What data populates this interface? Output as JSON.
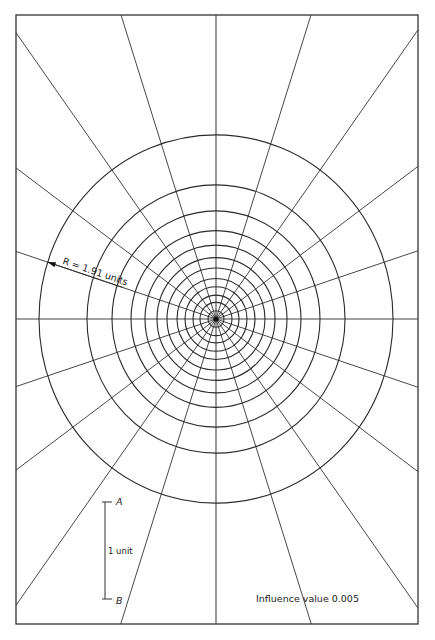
{
  "diagram": {
    "type": "influence chart (Newmark-style radial grid)",
    "frame": {
      "x": 16,
      "y": 15,
      "width": 402,
      "height": 609
    },
    "center": {
      "x": 216,
      "y": 319
    },
    "vertical_stretch": 1.04,
    "ray_count": 20,
    "ray_angle_step_deg": 18,
    "ring_radii_px": [
      8,
      16,
      23,
      31,
      39,
      49,
      59,
      71,
      85,
      104,
      129,
      177
    ],
    "radius_annotation": {
      "text": "R = 1.91 units",
      "arrow_tip": {
        "x": 40,
        "y": 261
      },
      "angle_deg": 18.5
    },
    "scale_bar": {
      "x": 105,
      "y_top": 502,
      "y_bottom": 599,
      "top_label": "A",
      "bottom_label": "B",
      "length_label": "1 unit"
    },
    "influence_value_text": "Influence value 0.005"
  }
}
